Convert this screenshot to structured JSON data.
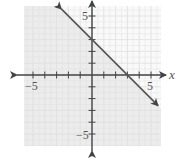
{
  "chart_data": {
    "type": "line",
    "title": "",
    "xlabel": "x",
    "ylabel": "",
    "xlim": [
      -5.5,
      6
    ],
    "ylim": [
      -6,
      6
    ],
    "grid": true,
    "x_ticks": [
      -5,
      -4,
      -3,
      -2,
      -1,
      1,
      2,
      3,
      4,
      5
    ],
    "y_ticks": [
      -5,
      -4,
      -3,
      -2,
      -1,
      1,
      2,
      3,
      4,
      5
    ],
    "x_tick_labels": [
      {
        "value": -5,
        "label": "−5"
      },
      {
        "value": 5,
        "label": "5"
      }
    ],
    "y_tick_labels": [
      {
        "value": 5,
        "label": "5"
      },
      {
        "value": -5,
        "label": "−5"
      }
    ],
    "series": [
      {
        "name": "boundary line",
        "equation": "y = -x + 3",
        "slope": -1,
        "intercept": 3,
        "style": "solid",
        "arrows": "both",
        "points": [
          {
            "x": -2.6,
            "y": 5.6
          },
          {
            "x": 0,
            "y": 3
          },
          {
            "x": 3,
            "y": 0
          },
          {
            "x": 5.6,
            "y": -2.6
          }
        ]
      }
    ],
    "shaded_region": "below line (y <= -x + 3)",
    "colors": {
      "line": "#555555",
      "axis": "#444444",
      "grid": "#dedede",
      "shade": "#ececec",
      "unshaded": "#f9f9f9"
    }
  },
  "labels": {
    "x_axis": "x",
    "x_neg5": "−5",
    "x_pos5": "5",
    "y_pos5": "5",
    "y_neg5": "−5"
  }
}
